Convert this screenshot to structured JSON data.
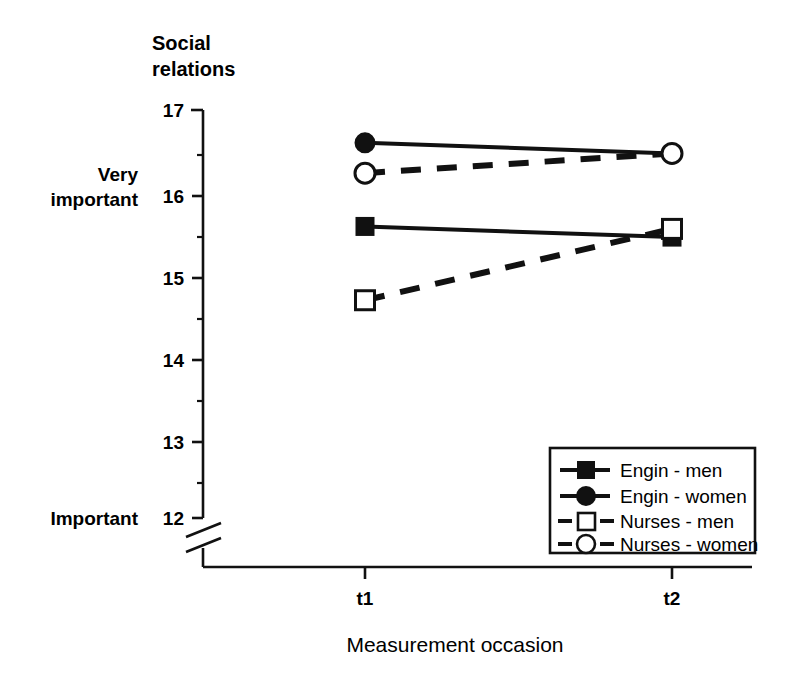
{
  "chart_data": {
    "type": "line",
    "title": "Social relations",
    "xlabel": "Measurement occasion",
    "ylabel": "",
    "categories": [
      "t1",
      "t2"
    ],
    "x_tick_labels": [
      "t1",
      "t2"
    ],
    "y_tick_labels": [
      "12",
      "13",
      "14",
      "15",
      "16",
      "17"
    ],
    "y_tick_values": [
      12,
      13,
      14,
      15,
      16,
      17
    ],
    "ylim": [
      12,
      17
    ],
    "y_minor_ticks": [
      12.5,
      13.5,
      14.5,
      15.5,
      16.5
    ],
    "y_axis_break": true,
    "y_anchor_labels": [
      {
        "text": "Very\nimportant",
        "line1": "Very",
        "line2": "important",
        "value": 16
      },
      {
        "text": "Important",
        "line1": "Important",
        "line2": "",
        "value": 12
      }
    ],
    "grid": false,
    "legend_position": "bottom-right",
    "series": [
      {
        "name": "Engin - men",
        "marker": "filled-square",
        "linestyle": "solid",
        "values": [
          15.58,
          15.45
        ]
      },
      {
        "name": "Engin - women",
        "marker": "filled-circle",
        "linestyle": "solid",
        "values": [
          16.6,
          16.47
        ]
      },
      {
        "name": "Nurses - men",
        "marker": "open-square",
        "linestyle": "dashed",
        "values": [
          14.68,
          15.55
        ]
      },
      {
        "name": "Nurses - women",
        "marker": "open-circle",
        "linestyle": "dashed",
        "values": [
          16.23,
          16.47
        ]
      }
    ],
    "colors": {
      "ink": "#111111",
      "background": "#ffffff",
      "marker_fill_open": "#ffffff"
    }
  },
  "legend": {
    "items": [
      {
        "label": "Engin - men"
      },
      {
        "label": "Engin - women"
      },
      {
        "label": "Nurses - men"
      },
      {
        "label": "Nurses - women"
      }
    ]
  }
}
